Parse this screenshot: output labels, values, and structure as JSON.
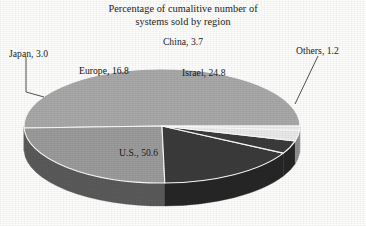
{
  "chart_data": {
    "type": "pie",
    "title": "Percentage of cumalitive number of systems sold by region",
    "title_line1": "Percentage of cumalitive number of",
    "title_line2": "systems sold by region",
    "xlabel": "",
    "ylabel": "",
    "legend": "none",
    "grid": false,
    "units": "percent",
    "total": 100.1,
    "three_d": true,
    "categories": [
      "U.S.",
      "Israel",
      "Europe",
      "China",
      "Japan",
      "Others"
    ],
    "values": [
      50.6,
      24.8,
      16.8,
      3.7,
      3.0,
      1.2
    ],
    "slices": [
      {
        "label": "U.S., 50.6",
        "name": "U.S.",
        "value": 50.6,
        "color": "#a8a8a8",
        "side_color": "#616161",
        "label_inside": true
      },
      {
        "label": "Israel, 24.8",
        "name": "Israel",
        "value": 24.8,
        "color": "#9b9b9b",
        "side_color": "#5a5a5a",
        "label_inside": true
      },
      {
        "label": "Europe, 16.8",
        "name": "Europe",
        "value": 16.8,
        "color": "#3b3b3b",
        "side_color": "#262626",
        "label_inside": true
      },
      {
        "label": "China, 3.7",
        "name": "China",
        "value": 3.7,
        "color": "#3b3b3b",
        "side_color": "#262626",
        "label_inside": false
      },
      {
        "label": "Japan, 3.0",
        "name": "Japan",
        "value": 3.0,
        "color": "#e9e9e9",
        "side_color": "#8f8f8f",
        "label_inside": false
      },
      {
        "label": "Others, 1.2",
        "name": "Others",
        "value": 1.2,
        "color": "#e9e9e9",
        "side_color": "#8f8f8f",
        "label_inside": false
      }
    ],
    "colors": {
      "background": "#fdfdfc",
      "text": "#1c1c1c",
      "light_gray": "#a8a8a8",
      "mid_gray": "#9b9b9b",
      "dark_gray": "#3b3b3b",
      "pale_gray": "#e9e9e9",
      "side_wall": "#616161"
    }
  },
  "labels": {
    "china": "China, 3.7",
    "japan": "Japan, 3.0",
    "others": "Others, 1.2",
    "europe": "Europe, 16.8",
    "israel": "Israel, 24.8",
    "us": "U.S., 50.6"
  }
}
